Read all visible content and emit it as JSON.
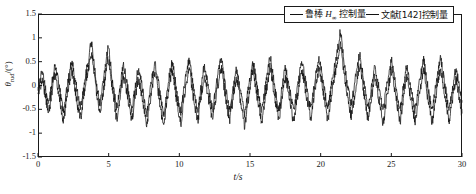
{
  "chart_data": {
    "type": "line",
    "title": "",
    "xlabel": "t/s",
    "ylabel": "θrud/(°)",
    "xlim": [
      0,
      30
    ],
    "ylim": [
      -1.5,
      1.5
    ],
    "xticks": [
      "0",
      "5",
      "10",
      "15",
      "20",
      "25",
      "30"
    ],
    "xtick_values": [
      0,
      5,
      10,
      15,
      20,
      25,
      30
    ],
    "yticks": [
      "1.5",
      "1",
      "0.5",
      "0",
      "-0.5",
      "-1",
      "-1.5"
    ],
    "ytick_values": [
      1.5,
      1,
      0.5,
      0,
      -0.5,
      -1,
      -1.5
    ],
    "grid": false,
    "legend_position": "top-right",
    "series": [
      {
        "name": "鲁棒 H∞ 控制量",
        "color": "#111111",
        "values": [
          -0.06,
          0.12,
          0.3,
          0.05,
          -0.2,
          -0.38,
          -0.12,
          0.18,
          0.42,
          0.2,
          -0.05,
          -0.3,
          -0.5,
          -0.22,
          0.05,
          0.33,
          0.5,
          0.26,
          -0.02,
          -0.28,
          -0.42,
          -0.18,
          0.1,
          0.38,
          0.62,
          0.9,
          0.55,
          0.2,
          -0.12,
          -0.35,
          -0.1,
          0.22,
          0.52,
          0.78,
          0.45,
          0.1,
          -0.22,
          -0.45,
          -0.2,
          0.12,
          0.4,
          0.24,
          -0.02,
          -0.3,
          -0.48,
          -0.25,
          0.05,
          0.3,
          0.18,
          -0.08,
          -0.35,
          -0.58,
          -0.3,
          0.0,
          0.25,
          0.42,
          0.2,
          -0.1,
          -0.4,
          -0.62,
          -0.32,
          0.0,
          0.3,
          0.48,
          0.22,
          -0.08,
          -0.35,
          -0.55,
          -0.25,
          0.08,
          0.35,
          0.52,
          0.25,
          -0.05,
          -0.3,
          -0.5,
          -0.22,
          0.1,
          0.38,
          0.2,
          -0.05,
          -0.28,
          -0.48,
          -0.2,
          0.1,
          0.35,
          0.55,
          0.28,
          -0.02,
          -0.3,
          -0.5,
          -0.22,
          0.05,
          0.3,
          0.15,
          -0.1,
          -0.38,
          -0.58,
          -0.28,
          0.02,
          0.28,
          0.5,
          0.22,
          -0.08,
          -0.32,
          -0.52,
          -0.25,
          0.05,
          0.32,
          0.6,
          0.3,
          0.0,
          -0.28,
          -0.5,
          -0.22,
          0.08,
          0.35,
          0.18,
          -0.06,
          -0.3,
          -0.52,
          -0.25,
          0.05,
          0.3,
          0.48,
          0.25,
          -0.02,
          -0.28,
          -0.45,
          -0.2,
          0.1,
          0.35,
          0.55,
          0.3,
          0.0,
          -0.25,
          -0.48,
          -0.22,
          0.08,
          0.35,
          0.6,
          0.85,
          1.12,
          0.75,
          0.4,
          0.1,
          -0.15,
          -0.38,
          -0.15,
          0.15,
          0.42,
          0.62,
          0.35,
          0.05,
          -0.22,
          -0.45,
          -0.2,
          0.1,
          0.38,
          0.18,
          -0.05,
          -0.3,
          -0.52,
          -0.22,
          0.08,
          0.32,
          0.5,
          0.25,
          -0.02,
          -0.28,
          -0.48,
          -0.2,
          0.1,
          0.36,
          0.2,
          -0.05,
          -0.3,
          -0.5,
          -0.25,
          0.05,
          0.3,
          0.52,
          0.25,
          -0.05,
          -0.3,
          -0.5,
          -0.22,
          0.08,
          0.32,
          0.55,
          0.28,
          0.0,
          -0.28,
          -0.48,
          -0.22,
          0.05,
          0.3,
          0.15,
          -0.1,
          -0.35
        ]
      },
      {
        "name": "文献[142]控制量",
        "color": "#111111",
        "values": [
          -0.25,
          -0.05,
          0.15,
          -0.1,
          -0.35,
          -0.55,
          -0.3,
          0.0,
          0.22,
          0.0,
          -0.28,
          -0.52,
          -0.72,
          -0.42,
          -0.12,
          0.15,
          0.3,
          0.05,
          -0.25,
          -0.5,
          -0.65,
          -0.38,
          -0.05,
          0.2,
          0.42,
          0.68,
          0.35,
          0.0,
          -0.3,
          -0.55,
          -0.3,
          0.0,
          0.3,
          0.55,
          0.25,
          -0.1,
          -0.42,
          -0.68,
          -0.4,
          -0.08,
          0.18,
          0.02,
          -0.22,
          -0.5,
          -0.72,
          -0.45,
          -0.15,
          0.1,
          -0.02,
          -0.28,
          -0.55,
          -0.8,
          -0.5,
          -0.2,
          0.05,
          0.22,
          0.0,
          -0.3,
          -0.6,
          -0.85,
          -0.52,
          -0.2,
          0.1,
          0.28,
          0.02,
          -0.28,
          -0.55,
          -0.78,
          -0.45,
          -0.12,
          0.15,
          0.32,
          0.05,
          -0.25,
          -0.5,
          -0.72,
          -0.42,
          -0.1,
          0.18,
          0.0,
          -0.25,
          -0.5,
          -0.7,
          -0.4,
          -0.1,
          0.15,
          0.35,
          0.08,
          -0.22,
          -0.5,
          -0.72,
          -0.42,
          -0.15,
          0.1,
          -0.05,
          -0.3,
          -0.58,
          -0.82,
          -0.5,
          -0.18,
          0.08,
          0.3,
          0.02,
          -0.28,
          -0.52,
          -0.75,
          -0.45,
          -0.15,
          0.12,
          0.4,
          0.1,
          -0.2,
          -0.48,
          -0.7,
          -0.42,
          -0.12,
          0.15,
          -0.02,
          -0.28,
          -0.52,
          -0.75,
          -0.45,
          -0.15,
          0.1,
          0.28,
          0.05,
          -0.22,
          -0.48,
          -0.68,
          -0.4,
          -0.1,
          0.15,
          0.35,
          0.1,
          -0.2,
          -0.45,
          -0.7,
          -0.42,
          -0.12,
          0.15,
          0.38,
          0.6,
          0.82,
          0.5,
          0.18,
          -0.12,
          -0.38,
          -0.62,
          -0.38,
          -0.08,
          0.2,
          0.4,
          0.12,
          -0.18,
          -0.45,
          -0.68,
          -0.4,
          -0.1,
          0.18,
          -0.02,
          -0.28,
          -0.52,
          -0.78,
          -0.48,
          -0.15,
          0.12,
          0.3,
          0.05,
          -0.25,
          -0.5,
          -0.72,
          -0.42,
          -0.1,
          0.16,
          0.0,
          -0.28,
          -0.52,
          -0.75,
          -0.48,
          -0.18,
          0.1,
          0.32,
          0.05,
          -0.28,
          -0.52,
          -0.75,
          -0.45,
          -0.12,
          0.15,
          0.35,
          0.08,
          -0.22,
          -0.5,
          -0.72,
          -0.45,
          -0.15,
          0.1,
          -0.05,
          -0.32,
          -0.58
        ]
      }
    ]
  },
  "legend": {
    "entry1_prefix": "鲁棒 ",
    "entry1_symbol": "H",
    "entry1_sub": "∞",
    "entry1_suffix": " 控制量",
    "entry2_text": "文献[142]控制量"
  },
  "axes": {
    "y_title_theta": "θ",
    "y_title_sub": "rud",
    "y_title_unit": "/(°)",
    "x_title": "t/s"
  }
}
